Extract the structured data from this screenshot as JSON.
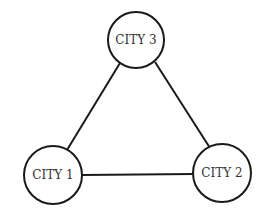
{
  "diagram": {
    "type": "graph",
    "nodes": [
      {
        "id": "city1",
        "label": "CITY 1",
        "cx": 53,
        "cy": 175,
        "r": 29
      },
      {
        "id": "city2",
        "label": "CITY 2",
        "cx": 222,
        "cy": 173,
        "r": 29
      },
      {
        "id": "city3",
        "label": "CITY 3",
        "cx": 136,
        "cy": 40,
        "r": 28
      }
    ],
    "edges": [
      {
        "from": "city1",
        "to": "city3"
      },
      {
        "from": "city3",
        "to": "city2"
      },
      {
        "from": "city1",
        "to": "city2"
      }
    ],
    "colors": {
      "stroke": "#1a1a1a",
      "text": "#333333",
      "background": "#ffffff"
    }
  }
}
